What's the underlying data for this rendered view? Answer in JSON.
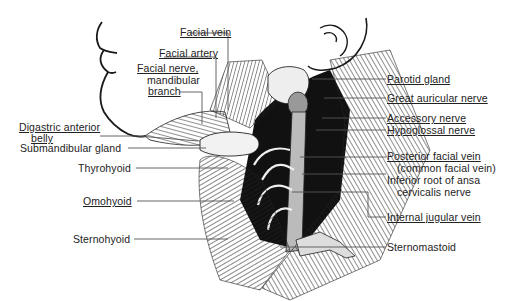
{
  "figure": {
    "labels": {
      "facial_vein": "Facial vein",
      "facial_artery": "Facial artery",
      "facial_nerve_1": "Facial nerve,",
      "facial_nerve_2": "mandibular",
      "facial_nerve_3": "branch",
      "digastric_1": "Digastric anterior",
      "digastric_2": "belly",
      "submandibular_gland": "Submandibular gland",
      "thyrohyoid": "Thyrohyoid",
      "omohyoid": "Omohyoid",
      "sternohyoid": "Sternohyoid",
      "parotid_gland": "Parotid gland",
      "great_auricular_nerve": "Great auricular nerve",
      "accessory_nerve": "Accessory nerve",
      "hypoglossal_nerve": "Hypoglossal nerve",
      "posterior_facial_vein_1": "Posterior facial vein",
      "posterior_facial_vein_2": "(common facial vein)",
      "ansa_cervicalis_1": "Inferior root of ansa",
      "ansa_cervicalis_2": "cervicalis nerve",
      "internal_jugular_vein": "Internal jugular vein",
      "sternomastoid": "Sternomastoid"
    },
    "colors": {
      "ink": "#1a1a1a",
      "leader": "#555555",
      "background": "#ffffff"
    }
  }
}
